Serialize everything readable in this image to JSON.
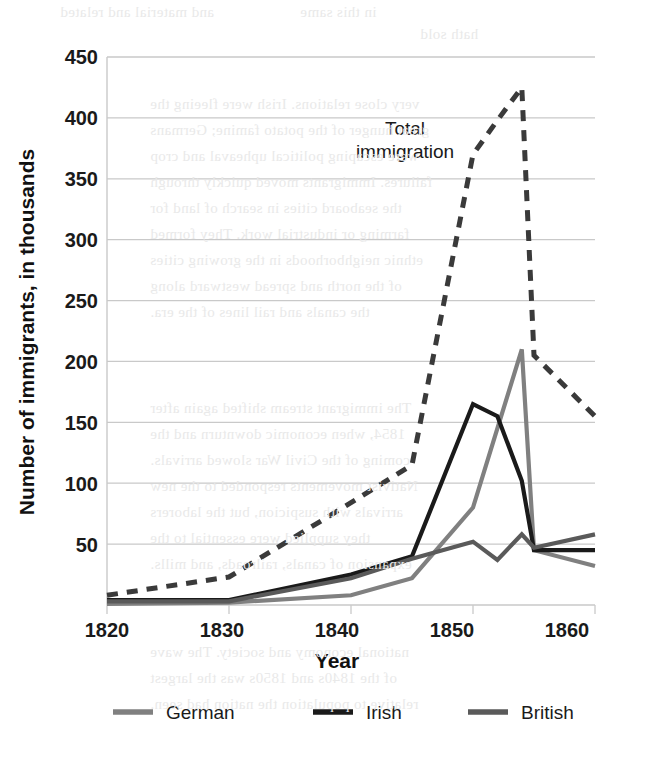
{
  "chart_data": {
    "type": "line",
    "title": "",
    "xlabel": "Year",
    "ylabel": "Number of immigrants, in thousands",
    "xlim": [
      1820,
      1860
    ],
    "ylim": [
      0,
      450
    ],
    "xticks": [
      1820,
      1830,
      1840,
      1850,
      1860
    ],
    "xtick_labels": [
      "1820",
      "1830",
      "1840",
      "1850",
      "1860"
    ],
    "yticks": [
      0,
      50,
      100,
      150,
      200,
      250,
      300,
      350,
      400,
      450
    ],
    "ytick_labels": [
      "50",
      "100",
      "150",
      "200",
      "250",
      "300",
      "350",
      "400",
      "450"
    ],
    "grid": "horizontal",
    "legend_position": "bottom",
    "annotations": [
      {
        "text": "Total immigration",
        "x": 1847,
        "y": 390
      }
    ],
    "series": [
      {
        "name": "Total immigration",
        "style": "dashed",
        "color": "#3a3a3a",
        "in_legend": false,
        "x": [
          1820,
          1830,
          1840,
          1845,
          1850,
          1852,
          1854,
          1855,
          1860
        ],
        "y": [
          8,
          23,
          84,
          115,
          370,
          398,
          425,
          205,
          155
        ]
      },
      {
        "name": "German",
        "style": "solid",
        "color": "#808080",
        "in_legend": true,
        "x": [
          1820,
          1830,
          1840,
          1845,
          1850,
          1852,
          1854,
          1855,
          1860
        ],
        "y": [
          1,
          2,
          8,
          22,
          80,
          145,
          210,
          45,
          32
        ]
      },
      {
        "name": "Irish",
        "style": "solid",
        "color": "#1a1a1a",
        "in_legend": true,
        "x": [
          1820,
          1830,
          1840,
          1845,
          1850,
          1852,
          1854,
          1855,
          1860
        ],
        "y": [
          4,
          4,
          25,
          40,
          165,
          155,
          102,
          45,
          45
        ]
      },
      {
        "name": "British",
        "style": "solid",
        "color": "#5a5a5a",
        "in_legend": true,
        "x": [
          1820,
          1830,
          1840,
          1845,
          1850,
          1852,
          1854,
          1855,
          1860
        ],
        "y": [
          3,
          3,
          22,
          38,
          52,
          37,
          58,
          47,
          58
        ]
      }
    ]
  },
  "axes": {
    "ylabel": "Number of immigrants, in thousands",
    "xlabel": "Year",
    "ytick_450": "450",
    "ytick_400": "400",
    "ytick_350": "350",
    "ytick_300": "300",
    "ytick_250": "250",
    "ytick_200": "200",
    "ytick_150": "150",
    "ytick_100": "100",
    "ytick_50": "50",
    "xtick_1820": "1820",
    "xtick_1830": "1830",
    "xtick_1840": "1840",
    "xtick_1850": "1850",
    "xtick_1860": "1860"
  },
  "annotation": {
    "total_line1": "Total",
    "total_line2": "immigration"
  },
  "legend": {
    "items": [
      {
        "label": "German",
        "color": "#808080"
      },
      {
        "label": "Irish",
        "color": "#1a1a1a"
      },
      {
        "label": "British",
        "color": "#5a5a5a"
      }
    ],
    "german_label": "German",
    "irish_label": "Irish",
    "british_label": "British"
  },
  "colors": {
    "grid": "#c9c9c9",
    "text": "#1a1a1a",
    "german": "#808080",
    "irish": "#1a1a1a",
    "british": "#5a5a5a",
    "total": "#3a3a3a"
  },
  "background_bleed": {
    "l1": "and material and related",
    "l2": "in this same",
    "l3": "hath sold",
    "l4": "very close relations. Irish were fleeing the",
    "l5": "great hunger of the potato famine; Germans",
    "l6": "were escaping political upheaval and crop",
    "l7": "failures. Immigrants moved quickly through",
    "l8": "the seaboard cities in search of land for",
    "l9": "farming or industrial work. They formed",
    "l10": "ethnic neighborhoods in the growing cities",
    "l11": "of the north and spread westward along",
    "l12": "the canals and rail lines of the era.",
    "l13": "The immigrant stream shifted again after",
    "l14": "1854, when economic downturn and the",
    "l15": "coming of the Civil War slowed arrivals.",
    "l16": "Nativist movements responded to the new",
    "l17": "arrivals with suspicion, but the laborers",
    "l18": "they supplied were essential to the",
    "l19": "expansion of canals, railroads, and mills.",
    "l20": "national economy and society. The wave",
    "l21": "of the 1840s and 1850s was the largest",
    "l22": "relative to population the nation had seen."
  }
}
